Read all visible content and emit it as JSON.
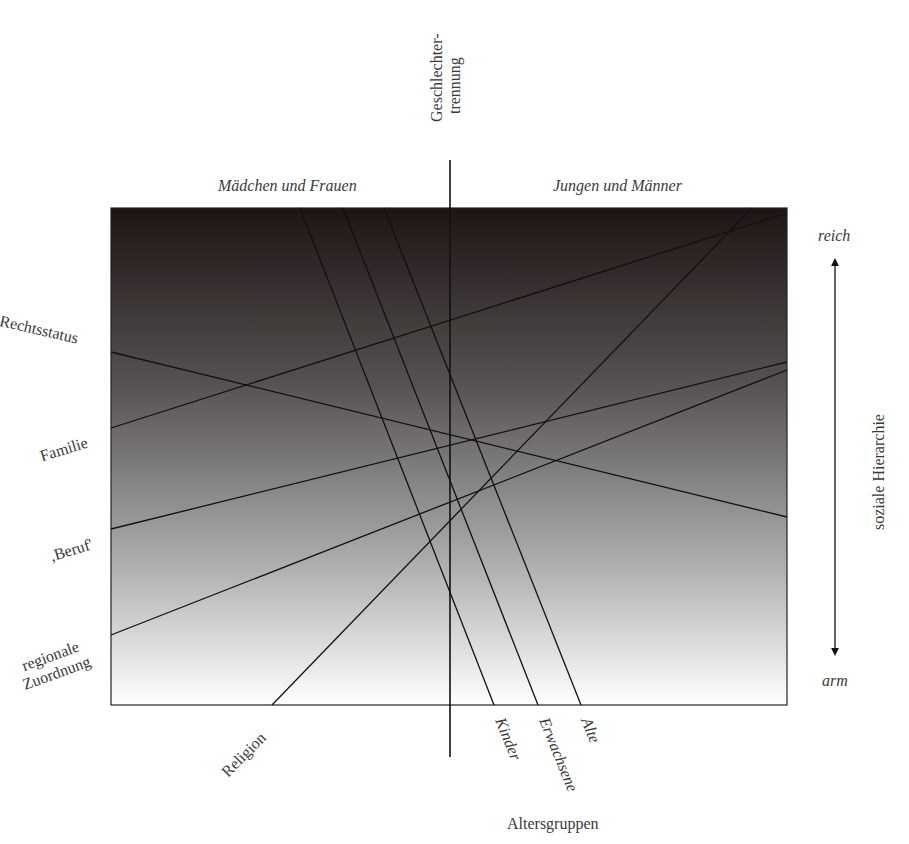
{
  "header": {
    "top_divider_label_line1": "Geschlechter-",
    "top_divider_label_line2": "trennung",
    "left_group": "Mädchen und Frauen",
    "right_group": "Jungen und Männer"
  },
  "right_axis": {
    "top": "reich",
    "bottom": "arm",
    "title": "soziale Hierarchie"
  },
  "left_labels": {
    "rechtsstatus": "Rechtsstatus",
    "familie": "Familie",
    "beruf": ",Beruf'",
    "regional_line1": "regionale",
    "regional_line2": "Zuordnung"
  },
  "bottom_labels": {
    "religion": "Religion",
    "kinder": "Kinder",
    "erwachsene": "Erwachsene",
    "alte": "Alte",
    "title": "Altersgruppen"
  },
  "colors": {
    "gradient_top": "#1e1414",
    "gradient_bottom": "#ffffff",
    "lines": "#111111"
  },
  "chart_data": {
    "type": "diagram",
    "title": "",
    "frame": {
      "x0": 111,
      "y0": 208,
      "x1": 787,
      "y1": 705
    },
    "divider": {
      "x": 450,
      "y0": 160,
      "y1": 757,
      "label": "Geschlechtertrennung"
    },
    "vertical_axis": {
      "label": "soziale Hierarchie",
      "top": "reich",
      "bottom": "arm"
    },
    "lines": [
      {
        "name": "Rechtsstatus",
        "from": [
          111,
          352
        ],
        "to": [
          787,
          517
        ]
      },
      {
        "name": "Familie",
        "from": [
          111,
          428
        ],
        "to": [
          787,
          213
        ]
      },
      {
        "name": "Beruf",
        "from": [
          111,
          529
        ],
        "to": [
          787,
          362
        ]
      },
      {
        "name": "regionale Zuordnung",
        "from": [
          111,
          635
        ],
        "to": [
          787,
          370
        ]
      },
      {
        "name": "Religion",
        "from": [
          272,
          705
        ],
        "to": [
          752,
          208
        ]
      },
      {
        "name": "Kinder",
        "from": [
          300,
          208
        ],
        "to": [
          494,
          705
        ]
      },
      {
        "name": "Erwachsene",
        "from": [
          343,
          208
        ],
        "to": [
          538,
          705
        ]
      },
      {
        "name": "Alte",
        "from": [
          384,
          208
        ],
        "to": [
          581,
          705
        ]
      }
    ],
    "groups": [
      "Mädchen und Frauen",
      "Jungen und Männer"
    ],
    "xlabel": "Altersgruppen"
  }
}
